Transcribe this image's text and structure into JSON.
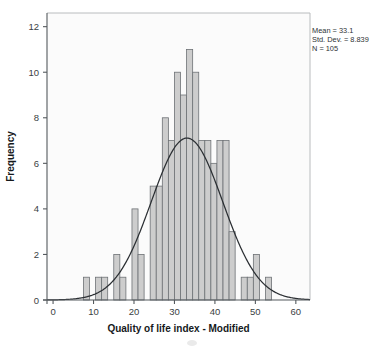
{
  "chart_data": {
    "type": "bar",
    "title": "",
    "subtitle": "",
    "xlabel": "Quality of life index - Modified",
    "ylabel": "Frequency",
    "xlim": [
      -1.5,
      63.5
    ],
    "ylim": [
      0,
      12.6
    ],
    "xticks": [
      0,
      10,
      20,
      30,
      40,
      50,
      60
    ],
    "yticks": [
      0,
      2,
      4,
      6,
      8,
      10,
      12
    ],
    "xtick_labels": [
      "0",
      "10",
      "20",
      "30",
      "40",
      "50",
      "60"
    ],
    "ytick_labels": [
      "0",
      "2",
      "4",
      "6",
      "8",
      "10",
      "12"
    ],
    "grid": false,
    "legend": null,
    "bin_width": 1.5,
    "bin_starts": [
      7.5,
      9.0,
      10.5,
      12.0,
      13.5,
      15.0,
      16.5,
      18.0,
      19.5,
      21.0,
      22.5,
      24.0,
      25.5,
      27.0,
      28.5,
      30.0,
      31.5,
      33.0,
      34.5,
      36.0,
      37.5,
      39.0,
      40.5,
      42.0,
      43.5,
      45.0,
      46.5,
      48.0,
      49.5,
      51.0,
      52.5,
      54.0
    ],
    "categories": [
      "7.5-9",
      "9-10.5",
      "10.5-12",
      "12-13.5",
      "13.5-15",
      "15-16.5",
      "16.5-18",
      "18-19.5",
      "19.5-21",
      "21-22.5",
      "22.5-24",
      "24-25.5",
      "25.5-27",
      "27-28.5",
      "28.5-30",
      "30-31.5",
      "31.5-33",
      "33-34.5",
      "34.5-36",
      "36-37.5",
      "37.5-39",
      "39-40.5",
      "40.5-42",
      "42-43.5",
      "43.5-45",
      "45-46.5",
      "46.5-48",
      "48-49.5",
      "49.5-51",
      "51-52.5",
      "52.5-54",
      "54-55.5"
    ],
    "values": [
      1,
      0,
      1,
      1,
      0,
      2,
      1,
      0,
      4,
      2,
      0,
      5,
      5,
      8,
      7,
      10,
      9,
      11,
      10,
      7,
      7,
      6,
      7,
      7,
      3,
      0,
      1,
      1,
      2,
      0,
      1,
      0
    ],
    "curve": {
      "kind": "normal",
      "mean": 33.1,
      "std": 8.839,
      "n": 105,
      "bin_width": 1.5,
      "stroke": "#2b2f33"
    },
    "bar_fill": "#cdcdcd",
    "bar_stroke": "#6e7276"
  },
  "annotations": {
    "stats_box": {
      "mean_label": "Mean = 33.1",
      "stddev_label": "Std. Dev. = 8.839",
      "n_label": "N = 105"
    }
  },
  "colors": {
    "axis": "#555a5e",
    "frame": "#b9bcbe",
    "text": "#2d3134",
    "bar_fill": "#cdcdcd",
    "bar_stroke": "#6e7276",
    "curve": "#2b2f33",
    "plot_background": "#fbfbfb",
    "page_background": "#ffffff"
  }
}
